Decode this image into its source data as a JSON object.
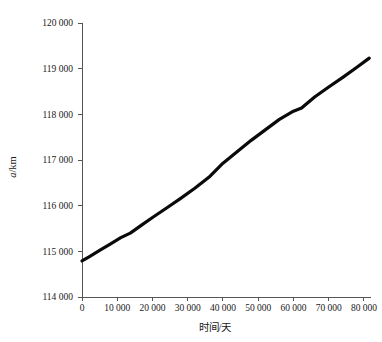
{
  "chart_data": {
    "type": "line",
    "title": "",
    "xlabel": "时间/天",
    "ylabel": "a/km",
    "ylabel_parts": {
      "variable": "a",
      "unit": "/km"
    },
    "xlim": [
      0,
      82000
    ],
    "ylim": [
      114000,
      120000
    ],
    "grid": false,
    "legend": null,
    "x_tick_labels": [
      "0",
      "10 000",
      "20 000",
      "30 000",
      "40 000",
      "50 000",
      "60 000",
      "70 000",
      "80 000"
    ],
    "x_ticks": [
      0,
      10000,
      20000,
      30000,
      40000,
      50000,
      60000,
      70000,
      80000
    ],
    "y_tick_labels": [
      "114 000",
      "115 000",
      "116 000",
      "117 000",
      "118 000",
      "119 000",
      "120 000"
    ],
    "y_ticks": [
      114000,
      115000,
      116000,
      117000,
      118000,
      119000,
      120000
    ],
    "series": [
      {
        "name": "a",
        "color": "#0a0a0a",
        "x": [
          0,
          2000,
          5000,
          8000,
          11000,
          13700,
          17000,
          20000,
          24000,
          28000,
          32000,
          36000,
          40000,
          44000,
          48000,
          52000,
          56000,
          60000,
          62300,
          66000,
          70000,
          74000,
          78000,
          81500
        ],
        "values": [
          114790,
          114880,
          115020,
          115160,
          115300,
          115400,
          115580,
          115740,
          115950,
          116160,
          116380,
          116620,
          116930,
          117180,
          117430,
          117660,
          117890,
          118070,
          118140,
          118380,
          118600,
          118810,
          119030,
          119230
        ]
      }
    ]
  },
  "figure": {
    "background_color": "#ffffff",
    "axis_color": "#555555",
    "text_color": "#1a1a1a"
  }
}
